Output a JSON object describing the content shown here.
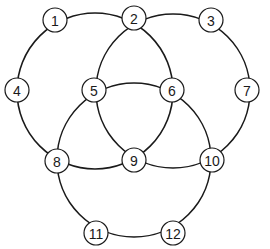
{
  "diagram": {
    "title": "",
    "colors": {
      "stroke": "#1a1a1a",
      "background": "#ffffff",
      "node_fill": "#ffffff"
    },
    "rings": [
      {
        "id": "left",
        "cx": 95,
        "cy": 91,
        "r": 78
      },
      {
        "id": "right",
        "cx": 173,
        "cy": 91,
        "r": 77
      },
      {
        "id": "bottom",
        "cx": 134,
        "cy": 160,
        "r": 77
      }
    ],
    "nodes": [
      {
        "label": "1",
        "x": 55,
        "y": 20
      },
      {
        "label": "2",
        "x": 134,
        "y": 18
      },
      {
        "label": "3",
        "x": 211,
        "y": 20
      },
      {
        "label": "4",
        "x": 17,
        "y": 90
      },
      {
        "label": "5",
        "x": 94,
        "y": 90
      },
      {
        "label": "6",
        "x": 172,
        "y": 90
      },
      {
        "label": "7",
        "x": 247,
        "y": 90
      },
      {
        "label": "8",
        "x": 57,
        "y": 161
      },
      {
        "label": "9",
        "x": 134,
        "y": 160
      },
      {
        "label": "10",
        "x": 212,
        "y": 160
      },
      {
        "label": "11",
        "x": 96,
        "y": 233
      },
      {
        "label": "12",
        "x": 173,
        "y": 233
      }
    ]
  }
}
